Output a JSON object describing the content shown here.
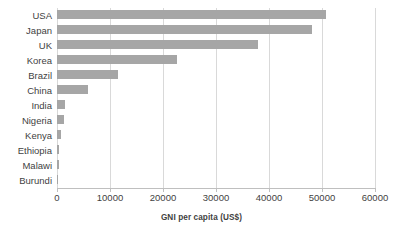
{
  "chart_data": {
    "type": "bar",
    "orientation": "horizontal",
    "title": "",
    "xlabel": "GNI per capita (US$)",
    "ylabel": "",
    "xlim": [
      0,
      60000
    ],
    "xticks": [
      0,
      10000,
      20000,
      30000,
      40000,
      50000,
      60000
    ],
    "xtick_labels": [
      "0",
      "10000",
      "20000",
      "30000",
      "40000",
      "50000",
      "60000"
    ],
    "grid": "vertical",
    "legend": "none",
    "bar_color": "#a6a6a6",
    "gridline_color": "#d9d9d9",
    "axis_color": "#bfbfbf",
    "text_color": "#3f3f3f",
    "categories": [
      "USA",
      "Japan",
      "UK",
      "Korea",
      "Brazil",
      "China",
      "India",
      "Nigeria",
      "Kenya",
      "Ethiopia",
      "Malawi",
      "Burundi"
    ],
    "values": [
      50800,
      48200,
      38000,
      22700,
      11600,
      5800,
      1500,
      1400,
      840,
      400,
      340,
      240
    ],
    "series": [
      {
        "name": "GNI per capita (US$)",
        "values": [
          50800,
          48200,
          38000,
          22700,
          11600,
          5800,
          1500,
          1400,
          840,
          400,
          340,
          240
        ]
      }
    ]
  }
}
